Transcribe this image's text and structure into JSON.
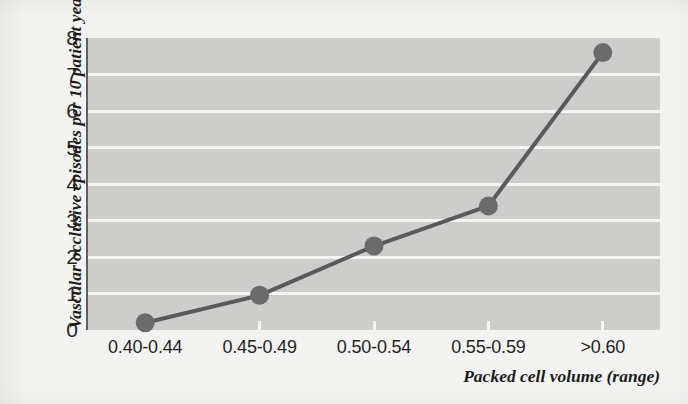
{
  "chart_data": {
    "type": "line",
    "title": "",
    "subtitle": "",
    "xlabel": "Packed cell volume (range)",
    "ylabel": "Vascular occlusive episodes per 10 patient years",
    "categories": [
      "0.40-0.44",
      "0.45-0.49",
      "0.50-0.54",
      "0.55-0.59",
      ">0.60"
    ],
    "values": [
      0.2,
      0.95,
      2.3,
      3.4,
      7.6
    ],
    "series": [
      {
        "name": "Vascular occlusive episodes per 10 patient years",
        "values": [
          0.2,
          0.95,
          2.3,
          3.4,
          7.6
        ]
      }
    ],
    "ylim": [
      0,
      8
    ],
    "yticks": [
      0,
      1,
      2,
      3,
      4,
      5,
      6,
      7,
      8
    ],
    "ytick_labels": [
      "0",
      "1",
      "2",
      "3",
      "4",
      "5",
      "6",
      "7",
      "8"
    ],
    "grid": true,
    "grid_axis": "y",
    "grid_color": "#f4f4f2",
    "legend": false,
    "legend_position": "none",
    "marker": "circle",
    "line_color": "#5a5a5a",
    "marker_color": "#6b6b6b",
    "plot_background": "#cdcdcb",
    "figure_background": "#f3f3f1"
  }
}
